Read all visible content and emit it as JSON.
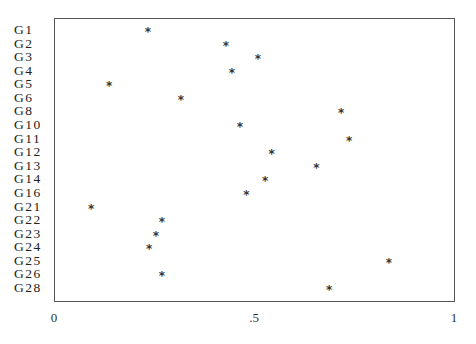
{
  "chart_data": {
    "type": "scatter",
    "title": "",
    "xlabel": "",
    "ylabel": "",
    "xlim": [
      0,
      1
    ],
    "grid": false,
    "legend": null,
    "marker": "*",
    "x_ticks": [
      {
        "value": 0,
        "label": "0"
      },
      {
        "value": 0.5,
        "label": ".5"
      },
      {
        "value": 1,
        "label": "1"
      }
    ],
    "categories": [
      "G1",
      "G2",
      "G3",
      "G4",
      "G5",
      "G6",
      "G8",
      "G10",
      "G11",
      "G12",
      "G13",
      "G14",
      "G16",
      "G21",
      "G22",
      "G23",
      "G24",
      "G25",
      "G26",
      "G28"
    ],
    "values": [
      0.235,
      0.43,
      0.51,
      0.445,
      0.138,
      0.317,
      0.718,
      0.465,
      0.738,
      0.544,
      0.656,
      0.528,
      0.481,
      0.093,
      0.27,
      0.255,
      0.238,
      0.837,
      0.27,
      0.688
    ]
  }
}
